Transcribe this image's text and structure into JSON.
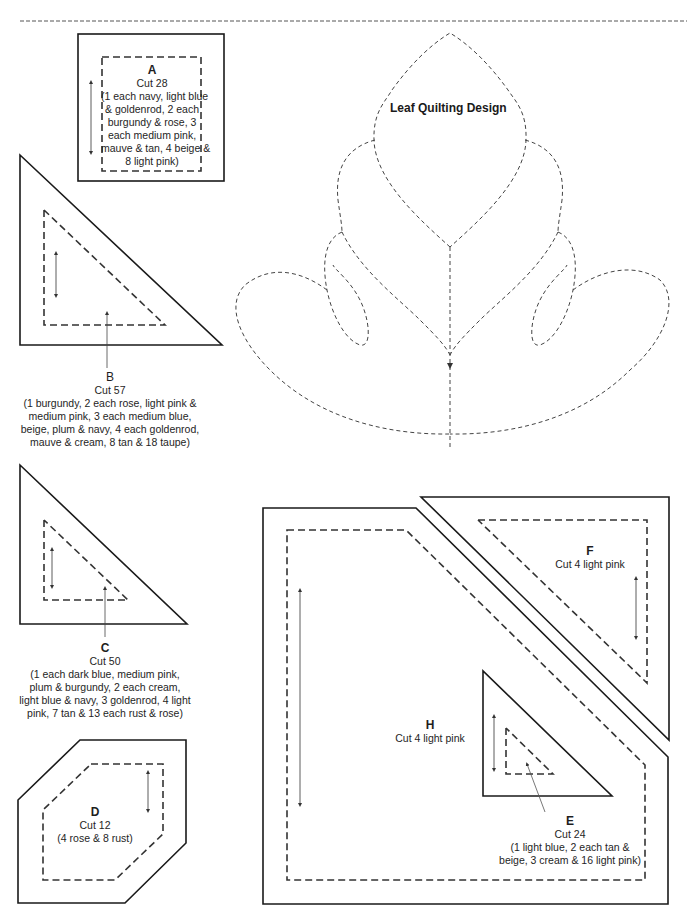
{
  "page": {
    "colors": {
      "ink": "#1a1a1a",
      "dash": "#333333",
      "background": "#ffffff"
    }
  },
  "quilting_design": {
    "title": "Leaf Quilting Design"
  },
  "pieces": {
    "A": {
      "letter": "A",
      "cut": "Cut 28",
      "lines": [
        "(1 each navy, light blue",
        "& goldenrod, 2 each",
        "burgundy & rose, 3",
        "each medium pink,",
        "mauve & tan, 4 beige &",
        "8 light pink)"
      ]
    },
    "B": {
      "letter": "B",
      "cut": "Cut 57",
      "lines": [
        "(1 burgundy, 2 each rose, light pink &",
        "medium pink, 3 each medium blue,",
        "beige, plum & navy, 4 each goldenrod,",
        "mauve & cream, 8 tan & 18 taupe)"
      ]
    },
    "C": {
      "letter": "C",
      "cut": "Cut 50",
      "lines": [
        "(1 each dark blue, medium pink,",
        "plum & burgundy, 2 each cream,",
        "light blue & navy, 3 goldenrod, 4 light",
        "pink, 7 tan & 13 each rust & rose)"
      ]
    },
    "D": {
      "letter": "D",
      "cut": "Cut 12",
      "lines": [
        "(4 rose & 8 rust)"
      ]
    },
    "E": {
      "letter": "E",
      "cut": "Cut 24",
      "lines": [
        "(1 light blue, 2 each tan &",
        "beige, 3 cream & 16 light pink)"
      ]
    },
    "F": {
      "letter": "F",
      "cut": "Cut 4 light pink",
      "lines": []
    },
    "H": {
      "letter": "H",
      "cut": "Cut 4 light pink",
      "lines": []
    }
  }
}
